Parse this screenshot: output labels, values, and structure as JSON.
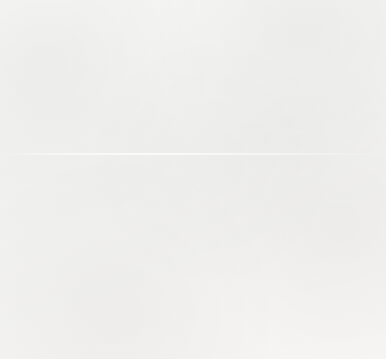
{
  "chart_data": {
    "type": "bar",
    "title": "",
    "subtitle": "",
    "xlabel": "",
    "ylabel": "Number of Drivers Who Offered Help",
    "categories": [
      "Model",
      "No Model"
    ],
    "values": [
      58,
      34
    ],
    "series": [
      {
        "name": "Number of Drivers Who Offered Help",
        "values": [
          58,
          34
        ]
      }
    ],
    "ylim": [
      0,
      70
    ],
    "y_ticks": [
      0,
      10,
      20,
      30,
      40,
      50,
      60,
      70
    ],
    "y_tick_labels": [
      "0",
      "10",
      "20",
      "30",
      "40",
      "50",
      "60",
      "70"
    ],
    "grid": false,
    "legend": false,
    "legend_position": "none",
    "annotations": [],
    "bar_color": "#8c8c8c",
    "axis_color": "#6e6e6e",
    "background_color": "#f4f4f3"
  },
  "figure": {
    "caption_fragment": ""
  }
}
